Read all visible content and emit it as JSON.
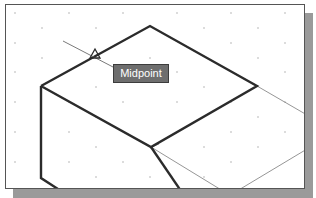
{
  "viewport": {
    "grid_dots": true,
    "colors": {
      "background": "#ffffff",
      "object_line": "#2b2b2b",
      "construction_line": "#8a8a8a",
      "tooltip_bg": "#6e6e6e",
      "tooltip_text": "#ffffff",
      "shadow": "#9a9a9a"
    }
  },
  "snap": {
    "marker": "midpoint-triangle",
    "tooltip_label": "Midpoint"
  }
}
